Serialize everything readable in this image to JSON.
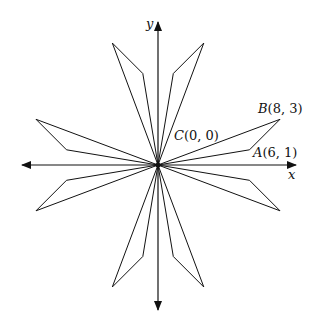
{
  "diagram": {
    "axes": {
      "x_label": "x",
      "y_label": "y"
    },
    "origin_px": [
      158,
      165
    ],
    "unit_px": 15.25,
    "points": [
      {
        "name": "B",
        "coords": "(8, 3)",
        "x": 8,
        "y": 3
      },
      {
        "name": "C",
        "coords": "(0, 0)",
        "x": 0,
        "y": 0
      },
      {
        "name": "A",
        "coords": "(6, 1)",
        "x": 6,
        "y": 1
      }
    ],
    "kites": [
      [
        [
          6,
          1
        ],
        [
          8,
          3
        ]
      ],
      [
        [
          1,
          6
        ],
        [
          3,
          8
        ]
      ],
      [
        [
          -1,
          6
        ],
        [
          -3,
          8
        ]
      ],
      [
        [
          -6,
          1
        ],
        [
          -8,
          3
        ]
      ],
      [
        [
          -6,
          -1
        ],
        [
          -8,
          -3
        ]
      ],
      [
        [
          -1,
          -6
        ],
        [
          -3,
          -8
        ]
      ],
      [
        [
          1,
          -6
        ],
        [
          3,
          -8
        ]
      ],
      [
        [
          6,
          -1
        ],
        [
          8,
          -3
        ]
      ]
    ]
  }
}
